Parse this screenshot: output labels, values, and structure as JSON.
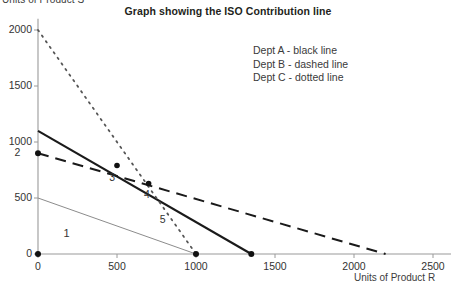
{
  "chart_data": {
    "type": "line",
    "title": "Graph showing the ISO Contribution line",
    "xlabel": "Units of Product R",
    "ylabel": "Units of Product S",
    "xlim": [
      0,
      2600
    ],
    "ylim": [
      0,
      2100
    ],
    "xticks": [
      0,
      500,
      1000,
      1500,
      2000,
      2500
    ],
    "xtick_labels": [
      "0",
      "500",
      "1000",
      "1500",
      "2000",
      "2500"
    ],
    "yticks": [
      0,
      500,
      1000,
      1500,
      2000
    ],
    "ytick_labels": [
      "0",
      "500",
      "1000",
      "1500",
      "2000"
    ],
    "grid": false,
    "legend_position": "upper-right-inside",
    "legend_entries": [
      "Dept A - black line",
      "Dept B - dashed line",
      "Dept C - dotted line"
    ],
    "series": [
      {
        "name": "Dept A",
        "style": "solid",
        "color": "#1a1a1a",
        "width": 2.1,
        "x": [
          0,
          1350
        ],
        "y": [
          1100,
          0
        ],
        "markers": [
          {
            "x": 1350,
            "y": 0
          }
        ]
      },
      {
        "name": "Dept B",
        "style": "dashed",
        "color": "#1a1a1a",
        "width": 2.0,
        "x": [
          0,
          2200
        ],
        "y": [
          900,
          0
        ],
        "markers": [
          {
            "x": 0,
            "y": 900
          }
        ]
      },
      {
        "name": "Dept C",
        "style": "dotted",
        "color": "#555555",
        "width": 1.8,
        "x": [
          0,
          1000
        ],
        "y": [
          2000,
          0
        ],
        "markers": [
          {
            "x": 1000,
            "y": 0
          }
        ]
      },
      {
        "name": "ISO Contribution line",
        "style": "solid-thin",
        "color": "#8c8c8c",
        "width": 1.0,
        "x": [
          0,
          1000
        ],
        "y": [
          500,
          0
        ],
        "markers": [
          {
            "x": 0,
            "y": 0
          }
        ]
      }
    ],
    "annotations": [
      {
        "text": "1",
        "x": 180,
        "y": 180
      },
      {
        "text": "2",
        "x": -130,
        "y": 900
      },
      {
        "text": "3",
        "x": 470,
        "y": 680
      },
      {
        "text": "4",
        "x": 690,
        "y": 530
      },
      {
        "text": "5",
        "x": 790,
        "y": 300
      }
    ],
    "intersections": [
      {
        "label": "3",
        "x": 500,
        "y": 790,
        "of": [
          "Dept A",
          "Dept B"
        ]
      },
      {
        "label": "4",
        "x": 700,
        "y": 630,
        "of": [
          "Dept A",
          "Dept C"
        ]
      }
    ]
  }
}
